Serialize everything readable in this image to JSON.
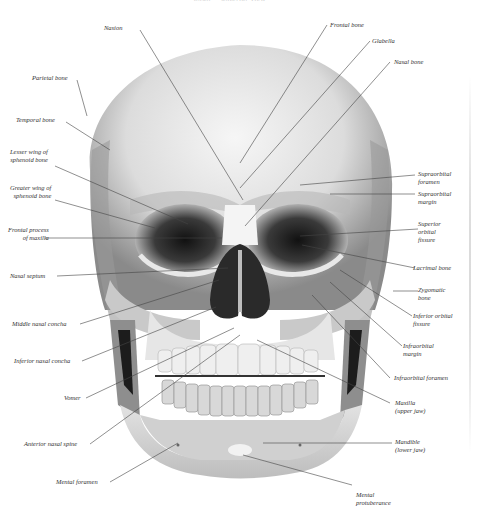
{
  "title": "Skull — anterior view",
  "labels": {
    "nasion": "Nasion",
    "parietal_bone": "Parietal bone",
    "temporal_bone": "Temporal bone",
    "lesser_wing": "Lesser wing of\nsphenoid bone",
    "greater_wing": "Greater wing of\nsphenoid bone",
    "frontal_process": "Frontal process\nof maxilla",
    "nasal_septum": "Nasal septum",
    "middle_nasal_concha": "Middle nasal concha",
    "inferior_nasal_concha": "Inferior nasal concha",
    "vomer": "Vomer",
    "anterior_nasal_spine": "Anterior nasal spine",
    "mental_foramen": "Mental foramen",
    "frontal_bone": "Frontal bone",
    "glabella": "Glabella",
    "nasal_bone": "Nasal bone",
    "supraorbital_foramen": "Supraorbital\nforamen",
    "supraorbital_margin": "Supraorbital\nmargin",
    "superior_orbital_fissure": "Superior\norbital\nfissure",
    "lacrimal_bone": "Lacrimal bone",
    "zygomatic_bone": "Zygomatic\nbone",
    "inferior_orbital_fissure": "Inferior orbital\nfissure",
    "infraorbital_margin": "Infraorbital\nmargin",
    "infraorbital_foramen": "Infraorbital foramen",
    "maxilla": "Maxilla\n(upper jaw)",
    "mandible": "Mandible\n(lower jaw)",
    "mental_protuberance": "Mental\nprotuberance"
  },
  "colors": {
    "background": "#ffffff",
    "leader": "#444444",
    "text": "#333333",
    "border": "#c8c8c8"
  }
}
